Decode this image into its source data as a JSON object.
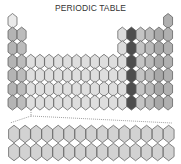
{
  "title": "PERIODIC TABLE",
  "colors": {
    "hydrogen": "#eaeaea",
    "alkali": "#b4b4b4",
    "alkaline_earth": "#bcbcbc",
    "transition": "#dedede",
    "group13": "#dcdcdc",
    "group14": "#4e4e4e",
    "group15": "#c4c4c4",
    "group16": "#bababa",
    "group17": "#a8a8a8",
    "group18": "#b0b0b0",
    "f_block": "#d2d2d2",
    "stroke": "#555555",
    "dotted_line": "#777777"
  },
  "layout": {
    "main_columns": 18,
    "main_rows": 7,
    "f_block_rows": 2,
    "f_block_columns": 15
  },
  "periods": [
    {
      "period": 1,
      "groups": [
        1,
        18
      ]
    },
    {
      "period": 2,
      "groups": [
        1,
        2,
        13,
        14,
        15,
        16,
        17,
        18
      ]
    },
    {
      "period": 3,
      "groups": [
        1,
        2,
        13,
        14,
        15,
        16,
        17,
        18
      ]
    },
    {
      "period": 4,
      "groups": [
        1,
        2,
        3,
        4,
        5,
        6,
        7,
        8,
        9,
        10,
        11,
        12,
        13,
        14,
        15,
        16,
        17,
        18
      ]
    },
    {
      "period": 5,
      "groups": [
        1,
        2,
        3,
        4,
        5,
        6,
        7,
        8,
        9,
        10,
        11,
        12,
        13,
        14,
        15,
        16,
        17,
        18
      ]
    },
    {
      "period": 6,
      "groups": [
        1,
        2,
        3,
        4,
        5,
        6,
        7,
        8,
        9,
        10,
        11,
        12,
        13,
        14,
        15,
        16,
        17,
        18
      ]
    },
    {
      "period": 7,
      "groups": [
        1,
        2,
        3,
        4,
        5,
        6,
        7,
        8,
        9,
        10,
        11,
        12,
        13,
        14,
        15,
        16,
        17,
        18
      ]
    }
  ],
  "highlighted_group": 14
}
